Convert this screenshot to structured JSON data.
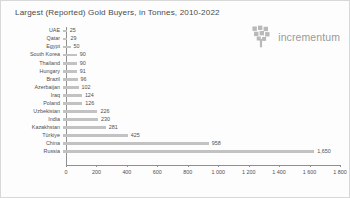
{
  "chart_data": {
    "type": "bar",
    "orientation": "horizontal",
    "title": "Largest (Reported) Gold Buyers, in Tonnes, 2010-2022",
    "xlabel": "",
    "ylabel": "",
    "xlim": [
      0,
      1800
    ],
    "grid": false,
    "legend": null,
    "bar_color": "#c2c2c2",
    "axis_color": "#8f8f8f",
    "text_color": "#4f4f4f",
    "tick_labels": [
      "0",
      "200",
      "400",
      "600",
      "800",
      "1 000",
      "1 200",
      "1 400",
      "1 600",
      "1 800"
    ],
    "tick_values": [
      0,
      200,
      400,
      600,
      800,
      1000,
      1200,
      1400,
      1600,
      1800
    ],
    "categories": [
      "UAE",
      "Qatar",
      "Egypt",
      "South Korea",
      "Thailand",
      "Hungary",
      "Brazil",
      "Azerbaijan",
      "Iraq",
      "Poland",
      "Uzbekistan",
      "India",
      "Kazakhstan",
      "Türkiye",
      "China",
      "Russia"
    ],
    "values": [
      25,
      29,
      50,
      90,
      90,
      91,
      96,
      102,
      124,
      126,
      226,
      230,
      281,
      425,
      958,
      1650
    ],
    "value_labels": [
      "25",
      "29",
      "50",
      "90",
      "90",
      "91",
      "96",
      "102",
      "124",
      "126",
      "226",
      "230",
      "281",
      "425",
      "958",
      "1,650"
    ]
  },
  "brand": {
    "wordmark": "incrementum",
    "mark_name": "tree-logo-mark"
  }
}
